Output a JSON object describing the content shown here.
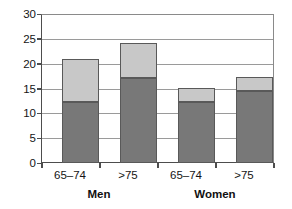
{
  "chart_data": {
    "type": "bar",
    "subtype": "stacked-vertical",
    "title": "",
    "subtitle": "",
    "xlabel": "",
    "ylabel": "",
    "ylim": [
      0,
      30
    ],
    "ytick_step": 5,
    "ytick_labels": [
      "0",
      "5",
      "10",
      "15",
      "20",
      "25",
      "30"
    ],
    "ytick_values": [
      0,
      5,
      10,
      15,
      20,
      25,
      30
    ],
    "grid": true,
    "grid_axis": "y",
    "legend": false,
    "legend_position": "none",
    "categories": [
      "65–74",
      ">75",
      "65–74",
      ">75"
    ],
    "groups": [
      {
        "label": "Men",
        "categories": [
          "65–74",
          ">75"
        ]
      },
      {
        "label": "Women",
        "categories": [
          "65–74",
          ">75"
        ]
      }
    ],
    "series": [
      {
        "name": "lower-segment",
        "color": "#787878",
        "values": [
          12.2,
          17.2,
          12.3,
          14.5
        ]
      },
      {
        "name": "upper-segment",
        "color": "#c8c8c8",
        "values": [
          8.8,
          7.0,
          2.9,
          2.8
        ]
      }
    ],
    "totals": [
      21.0,
      24.2,
      15.2,
      17.3
    ],
    "colors": {
      "lower_segment": "#787878",
      "upper_segment": "#c8c8c8",
      "bar_border": "#595959",
      "gridline": "#9a9a9a",
      "axis": "#4d4d4d",
      "background": "#ffffff",
      "text": "#151515"
    }
  }
}
